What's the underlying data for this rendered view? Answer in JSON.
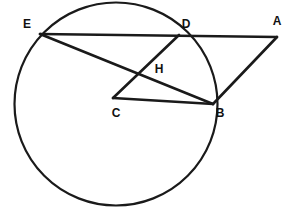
{
  "figure": {
    "type": "euclidean-geometry-diagram",
    "background_color": "#ffffff",
    "stroke_color": "#1a1a1a",
    "label_color": "#111111",
    "circle": {
      "name": "main-circle",
      "cx": 116,
      "cy": 104,
      "r": 101.5
    },
    "points": [
      {
        "id": "E",
        "label": "E",
        "x": 40,
        "y": 34,
        "label_x": 27,
        "label_y": 25,
        "on_circle": true
      },
      {
        "id": "D",
        "label": "D",
        "x": 179,
        "y": 35,
        "label_x": 186,
        "label_y": 25,
        "on_circle": true
      },
      {
        "id": "A",
        "label": "A",
        "x": 277,
        "y": 37,
        "label_x": 277,
        "label_y": 22,
        "on_circle": false
      },
      {
        "id": "B",
        "label": "B",
        "x": 213,
        "y": 104,
        "label_x": 220,
        "label_y": 114,
        "on_circle": true
      },
      {
        "id": "C",
        "label": "C",
        "x": 113,
        "y": 98,
        "label_x": 116,
        "label_y": 114,
        "on_circle": false
      },
      {
        "id": "H",
        "label": "H",
        "x": 144,
        "y": 76,
        "label_x": 159,
        "label_y": 70,
        "on_circle": false
      }
    ],
    "segments": [
      {
        "id": "EA",
        "label": "E-D-A secant",
        "from": "E",
        "to": "A",
        "x1": 40,
        "y1": 34,
        "x2": 277,
        "y2": 37
      },
      {
        "id": "EB",
        "label": "E-H-B chord",
        "from": "E",
        "to": "B",
        "x1": 40,
        "y1": 34,
        "x2": 213,
        "y2": 104
      },
      {
        "id": "DC",
        "label": "D-H-C segment",
        "from": "D",
        "to": "C",
        "x1": 179,
        "y1": 35,
        "x2": 113,
        "y2": 98
      },
      {
        "id": "CB",
        "label": "C-B segment",
        "from": "C",
        "to": "B",
        "x1": 113,
        "y1": 98,
        "x2": 213,
        "y2": 104
      },
      {
        "id": "AB",
        "label": "A-B segment",
        "from": "A",
        "to": "B",
        "x1": 277,
        "y1": 37,
        "x2": 213,
        "y2": 104
      }
    ]
  }
}
